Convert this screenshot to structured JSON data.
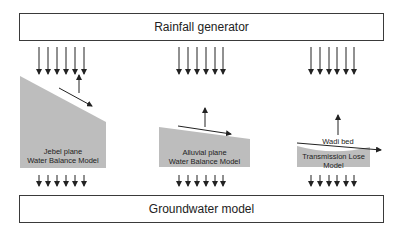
{
  "diagram": {
    "top_box": {
      "label": "Rainfall generator"
    },
    "bottom_box": {
      "label": "Groundwater model"
    },
    "components": [
      {
        "id": "jebel",
        "line1": "Jebel plane",
        "line2": "Water Balance Model"
      },
      {
        "id": "alluvial",
        "line1": "Alluvial plane",
        "line2": "Water Balance Model"
      },
      {
        "id": "transmission",
        "line1": "Transmission Lose",
        "line2": "Model"
      }
    ],
    "annotations": {
      "wadi_bed": "Wadi bed"
    },
    "colors": {
      "fill": "#bdbdbd",
      "stroke": "#222222",
      "box_border": "#3a3a3a"
    }
  }
}
